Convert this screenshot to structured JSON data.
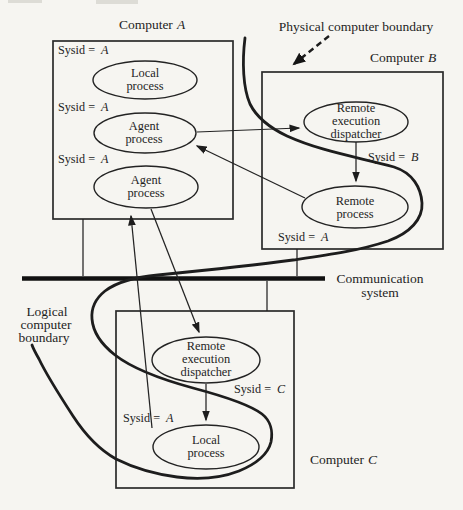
{
  "figure": {
    "bg": "#f6f5f1",
    "ink": "#232323",
    "description_colors": {
      "paper": "#f6f5f1",
      "line": "#1d1d1d"
    }
  },
  "labels": {
    "physical_boundary": "Physical computer boundary",
    "logical": {
      "line1": "Logical",
      "line2": "computer",
      "line3": "boundary"
    },
    "communication": {
      "line1": "Communication",
      "line2": "system"
    }
  },
  "computers": {
    "a": {
      "prefix": "Computer",
      "id": "A"
    },
    "b": {
      "prefix": "Computer",
      "id": "B"
    },
    "c": {
      "prefix": "Computer",
      "id": "C"
    }
  },
  "sysid": {
    "prefix": "Sysid =",
    "a_top": "A",
    "a_mid": "A",
    "a_bottom": "A",
    "b": "B",
    "b_remote": "A",
    "c": "C",
    "c_local": "A"
  },
  "processes": {
    "a_local": {
      "line1": "Local",
      "line2": "process"
    },
    "a_agent1": {
      "line1": "Agent",
      "line2": "process"
    },
    "a_agent2": {
      "line1": "Agent",
      "line2": "process"
    },
    "b_dispatcher": {
      "line1": "Remote",
      "line2": "execution",
      "line3": "dispatcher"
    },
    "b_remote": {
      "line1": "Remote",
      "line2": "process"
    },
    "c_dispatcher": {
      "line1": "Remote",
      "line2": "execution",
      "line3": "dispatcher"
    },
    "c_local": {
      "line1": "Local",
      "line2": "process"
    }
  }
}
